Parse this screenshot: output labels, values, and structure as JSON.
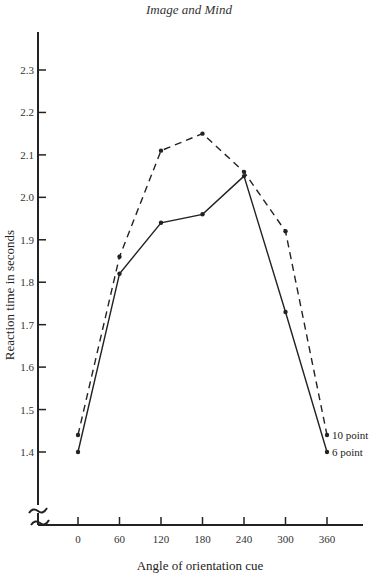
{
  "page": {
    "header": "Image and Mind"
  },
  "chart_data": {
    "type": "line",
    "title": "",
    "xlabel": "Angle of orientation cue",
    "ylabel": "Reaction time in seconds",
    "x": [
      0,
      60,
      120,
      180,
      240,
      300,
      360
    ],
    "x_tick_labels": [
      "0",
      "60",
      "120",
      "180",
      "240",
      "300",
      "360"
    ],
    "y_tick_labels": [
      "2.3",
      "2.2",
      "2.1",
      "2.0",
      "1.9",
      "1.8",
      "1.7",
      "1.6",
      "1.5",
      "1.4"
    ],
    "ylim": [
      1.3,
      2.35
    ],
    "y_axis_break": true,
    "grid": false,
    "legend_position": "inline at right end of lines",
    "series": [
      {
        "name": "10 point",
        "style": "dashed",
        "values": [
          1.44,
          1.86,
          2.11,
          2.15,
          2.06,
          1.92,
          1.44
        ]
      },
      {
        "name": "6 point",
        "style": "solid",
        "values": [
          1.4,
          1.82,
          1.94,
          1.96,
          2.05,
          1.73,
          1.4
        ]
      }
    ]
  }
}
